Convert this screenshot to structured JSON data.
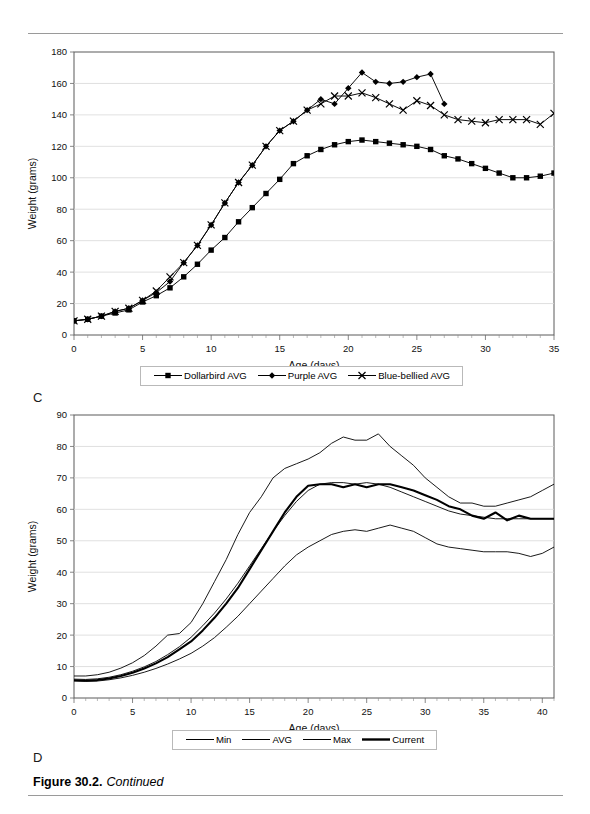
{
  "caption": {
    "figure_number": "Figure 30.2.",
    "continued": "Continued"
  },
  "panels": {
    "c_label": "C",
    "d_label": "D"
  },
  "chart_data": [
    {
      "id": "top",
      "panel": "C",
      "type": "line",
      "title": "",
      "xlabel": "Age (days)",
      "ylabel": "Weight (grams)",
      "xlim": [
        0,
        35
      ],
      "ylim": [
        0,
        180
      ],
      "xticks": [
        0,
        5,
        10,
        15,
        20,
        25,
        30,
        35
      ],
      "yticks": [
        0,
        20,
        40,
        60,
        80,
        100,
        120,
        140,
        160,
        180
      ],
      "xtick_step": 5,
      "xminor_step": 1,
      "grid": "horizontal",
      "legend_position": "below",
      "series": [
        {
          "name": "Dollarbird AVG",
          "marker": "square",
          "x": [
            0,
            1,
            2,
            3,
            4,
            5,
            6,
            7,
            8,
            9,
            10,
            11,
            12,
            13,
            14,
            15,
            16,
            17,
            18,
            19,
            20,
            21,
            22,
            23,
            24,
            25,
            26,
            27,
            28,
            29,
            30,
            31,
            32,
            33,
            34,
            35
          ],
          "values": [
            9,
            10,
            12,
            14,
            16,
            21,
            25,
            30,
            37,
            45,
            54,
            62,
            72,
            81,
            90,
            99,
            109,
            114,
            118,
            121,
            123,
            124,
            123,
            122,
            121,
            120,
            118,
            114,
            112,
            109,
            106,
            103,
            100,
            100,
            101,
            103
          ]
        },
        {
          "name": "Purple AVG",
          "marker": "diamond",
          "x": [
            0,
            1,
            2,
            3,
            4,
            5,
            6,
            7,
            8,
            9,
            10,
            11,
            12,
            13,
            14,
            15,
            16,
            17,
            18,
            19,
            20,
            21,
            22,
            23,
            24,
            25,
            26,
            27
          ],
          "values": [
            9,
            10,
            12,
            15,
            17,
            22,
            27,
            34,
            46,
            57,
            70,
            84,
            97,
            108,
            120,
            130,
            136,
            143,
            150,
            147,
            157,
            167,
            161,
            160,
            161,
            164,
            166,
            147
          ]
        },
        {
          "name": "Blue-bellied AVG",
          "marker": "cross",
          "x": [
            0,
            1,
            2,
            3,
            4,
            5,
            6,
            7,
            8,
            9,
            10,
            11,
            12,
            13,
            14,
            15,
            16,
            17,
            18,
            19,
            20,
            21,
            22,
            23,
            24,
            25,
            26,
            27,
            28,
            29,
            30,
            31,
            32,
            33,
            34,
            35
          ],
          "values": [
            9,
            10,
            12,
            15,
            17,
            22,
            28,
            37,
            46,
            57,
            70,
            84,
            97,
            108,
            120,
            130,
            136,
            143,
            147,
            152,
            152,
            154,
            151,
            147,
            143,
            149,
            146,
            140,
            137,
            136,
            135,
            137,
            137,
            137,
            134,
            141
          ]
        }
      ]
    },
    {
      "id": "bottom",
      "panel": "D",
      "type": "line",
      "title": "",
      "xlabel": "Age (days)",
      "ylabel": "Weight (grams)",
      "xlim": [
        0,
        41
      ],
      "ylim": [
        0,
        90
      ],
      "xticks": [
        0,
        5,
        10,
        15,
        20,
        25,
        30,
        35,
        40
      ],
      "yticks": [
        0,
        10,
        20,
        30,
        40,
        50,
        60,
        70,
        80,
        90
      ],
      "xtick_step": 5,
      "xminor_step": 1,
      "grid": "horizontal",
      "legend_position": "below",
      "series": [
        {
          "name": "Min",
          "marker": "none",
          "width": 0.9,
          "x": [
            0,
            1,
            2,
            3,
            4,
            5,
            6,
            7,
            8,
            9,
            10,
            11,
            12,
            13,
            14,
            15,
            16,
            17,
            18,
            19,
            20,
            21,
            22,
            23,
            24,
            25,
            26,
            27,
            28,
            29,
            30,
            31,
            32,
            33,
            34,
            35,
            36,
            37,
            38,
            39,
            40,
            41
          ],
          "values": [
            5.5,
            5.3,
            5.4,
            5.8,
            6.4,
            7.2,
            8.2,
            9.4,
            10.8,
            12.4,
            14.2,
            16.5,
            19.2,
            22.5,
            26,
            30,
            34,
            38,
            42,
            45.5,
            48,
            50,
            52,
            53,
            53.5,
            53,
            54,
            55,
            54,
            53,
            51,
            49,
            48,
            47.5,
            47,
            46.5,
            46.5,
            46.5,
            46,
            45,
            46,
            48
          ]
        },
        {
          "name": "AVG",
          "marker": "none",
          "width": 0.9,
          "x": [
            0,
            1,
            2,
            3,
            4,
            5,
            6,
            7,
            8,
            9,
            10,
            11,
            12,
            13,
            14,
            15,
            16,
            17,
            18,
            19,
            20,
            21,
            22,
            23,
            24,
            25,
            26,
            27,
            28,
            29,
            30,
            31,
            32,
            33,
            34,
            35,
            36,
            37,
            38,
            39,
            40,
            41
          ],
          "values": [
            6,
            5.9,
            6.1,
            6.6,
            7.4,
            8.5,
            9.9,
            11.6,
            13.8,
            16.3,
            19.3,
            23,
            27,
            31.5,
            36.5,
            42,
            47.5,
            53,
            58,
            62.5,
            66,
            68,
            68.5,
            68.5,
            68,
            68.5,
            68,
            67,
            65.5,
            64,
            62.5,
            61,
            59.5,
            58.5,
            58,
            57.5,
            57,
            57,
            57,
            57,
            57,
            57
          ]
        },
        {
          "name": "Max",
          "marker": "none",
          "width": 0.9,
          "x": [
            0,
            1,
            2,
            3,
            4,
            5,
            6,
            7,
            8,
            9,
            10,
            11,
            12,
            13,
            14,
            15,
            16,
            17,
            18,
            19,
            20,
            21,
            22,
            23,
            24,
            25,
            26,
            27,
            28,
            29,
            30,
            31,
            32,
            33,
            34,
            35,
            36,
            37,
            38,
            39,
            40,
            41
          ],
          "values": [
            7,
            7,
            7.4,
            8.2,
            9.5,
            11.2,
            13.5,
            16.5,
            20,
            20.5,
            24,
            30,
            37,
            44,
            52,
            59,
            64,
            70,
            73,
            74.5,
            76,
            78,
            81,
            83,
            82,
            82,
            84,
            80,
            77,
            74,
            70,
            67,
            64,
            62,
            62,
            61,
            61,
            62,
            63,
            64,
            66,
            68
          ]
        },
        {
          "name": "Current",
          "marker": "none",
          "width": 2.1,
          "x": [
            0,
            1,
            2,
            3,
            4,
            5,
            6,
            7,
            8,
            9,
            10,
            11,
            12,
            13,
            14,
            15,
            16,
            17,
            18,
            19,
            20,
            21,
            22,
            23,
            24,
            25,
            26,
            27,
            28,
            29,
            30,
            31,
            32,
            33,
            34,
            35,
            36,
            37,
            38,
            39,
            40,
            41
          ],
          "values": [
            5.6,
            5.5,
            5.7,
            6.2,
            7,
            8,
            9.4,
            11,
            13,
            15.5,
            18,
            21.5,
            25.5,
            30,
            35,
            41,
            47,
            53,
            59,
            64,
            67.5,
            68,
            68,
            67,
            68,
            67,
            68,
            68,
            67,
            66,
            64.5,
            63,
            61,
            60,
            58,
            57,
            59,
            56.5,
            58,
            57,
            57,
            57
          ]
        }
      ]
    }
  ],
  "legends": {
    "top": [
      {
        "label": "Dollarbird AVG",
        "marker": "square"
      },
      {
        "label": "Purple AVG",
        "marker": "diamond"
      },
      {
        "label": "Blue-bellied AVG",
        "marker": "cross"
      }
    ],
    "bottom": [
      {
        "label": "Min",
        "marker": "line",
        "width": 1
      },
      {
        "label": "AVG",
        "marker": "line",
        "width": 1
      },
      {
        "label": "Max",
        "marker": "line",
        "width": 1
      },
      {
        "label": "Current",
        "marker": "line",
        "width": 2.4
      }
    ]
  }
}
